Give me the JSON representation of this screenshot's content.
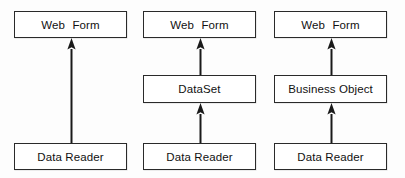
{
  "diagram": {
    "background_color": "#fdfdfd",
    "box_border_color": "#2a2a2a",
    "box_fill_color": "#ffffff",
    "arrow_color": "#1a1a1a",
    "columns": [
      {
        "id": "column-direct",
        "nodes": [
          {
            "id": "web-form",
            "label": "Web  Form",
            "row": "top"
          },
          {
            "id": "data-reader",
            "label": "Data Reader",
            "row": "bottom"
          }
        ],
        "arrows": [
          {
            "id": "arrow-data-reader-to-web-form",
            "from": "data-reader",
            "to": "web-form",
            "direction": "up"
          }
        ]
      },
      {
        "id": "column-dataset",
        "nodes": [
          {
            "id": "web-form",
            "label": "Web  Form",
            "row": "top"
          },
          {
            "id": "dataset",
            "label": "DataSet",
            "row": "middle"
          },
          {
            "id": "data-reader",
            "label": "Data Reader",
            "row": "bottom"
          }
        ],
        "arrows": [
          {
            "id": "arrow-dataset-to-web-form",
            "from": "dataset",
            "to": "web-form",
            "direction": "up"
          },
          {
            "id": "arrow-data-reader-to-dataset",
            "from": "data-reader",
            "to": "dataset",
            "direction": "up"
          }
        ]
      },
      {
        "id": "column-business-object",
        "nodes": [
          {
            "id": "web-form",
            "label": "Web  Form",
            "row": "top"
          },
          {
            "id": "business-object",
            "label": "Business Object",
            "row": "middle"
          },
          {
            "id": "data-reader",
            "label": "Data Reader",
            "row": "bottom"
          }
        ],
        "arrows": [
          {
            "id": "arrow-business-object-to-web-form",
            "from": "business-object",
            "to": "web-form",
            "direction": "up"
          },
          {
            "id": "arrow-data-reader-to-business-object",
            "from": "data-reader",
            "to": "business-object",
            "direction": "up"
          }
        ]
      }
    ]
  }
}
